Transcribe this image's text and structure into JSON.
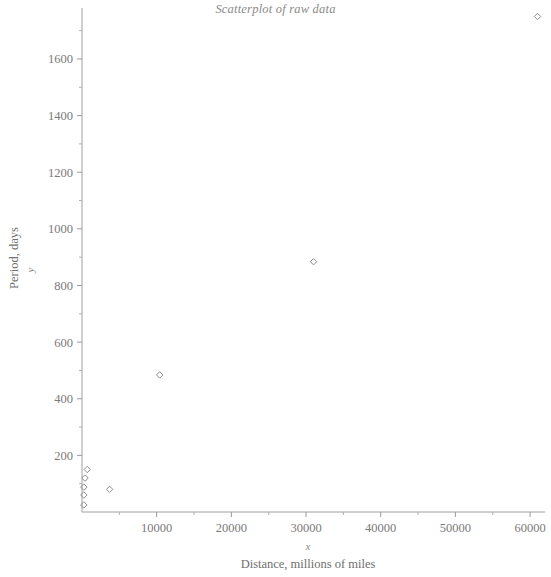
{
  "chart_data": {
    "type": "scatter",
    "title": "Scatterplot of raw data",
    "xlabel": "Distance,  millions of miles",
    "ylabel": "Period, days",
    "x_var": "x",
    "y_var": "y",
    "xlim": [
      0,
      62000
    ],
    "ylim": [
      0,
      1780
    ],
    "grid": false,
    "legend": false,
    "marker": "open-diamond",
    "marker_color": "#8c8c8c",
    "x_ticks": [
      10000,
      20000,
      30000,
      40000,
      50000,
      60000
    ],
    "x_tick_labels": [
      "10000",
      "20000",
      "30000",
      "40000",
      "50000",
      "60000"
    ],
    "x_minor_ticks": [
      5000,
      15000,
      25000,
      35000,
      45000,
      55000
    ],
    "y_ticks": [
      200,
      400,
      600,
      800,
      1000,
      1200,
      1400,
      1600
    ],
    "y_tick_labels": [
      "200",
      "400",
      "600",
      "800",
      "1000",
      "1200",
      "1400",
      "1600"
    ],
    "y_minor_ticks": [
      100,
      300,
      500,
      700,
      900,
      1100,
      1300,
      1500,
      1700
    ],
    "points": [
      {
        "x": 36,
        "y": 88
      },
      {
        "x": 67,
        "y": 225
      },
      {
        "x": 93,
        "y": 365
      },
      {
        "x": 142,
        "y": 687
      },
      {
        "x": 484,
        "y": 88
      },
      {
        "x": 886,
        "y": 4330
      },
      {
        "x": 1782,
        "y": 10760
      },
      {
        "x": 10000,
        "y": 484
      },
      {
        "x": 31000,
        "y": 884
      },
      {
        "x": 61000,
        "y": 1750
      },
      {
        "x": 3700,
        "y": 80
      },
      {
        "x": 700,
        "y": 150
      }
    ],
    "plotted_points": [
      {
        "x": 250,
        "y": 25
      },
      {
        "x": 250,
        "y": 60
      },
      {
        "x": 250,
        "y": 88
      },
      {
        "x": 400,
        "y": 120
      },
      {
        "x": 700,
        "y": 150
      },
      {
        "x": 3700,
        "y": 80
      },
      {
        "x": 10400,
        "y": 484
      },
      {
        "x": 31000,
        "y": 884
      },
      {
        "x": 61000,
        "y": 1750
      }
    ]
  },
  "colors": {
    "marker": "#8c8c8c",
    "axis": "#a0a0a0",
    "text": "#7a7a7a",
    "title": "#8a8a8a",
    "background": "#ffffff"
  }
}
